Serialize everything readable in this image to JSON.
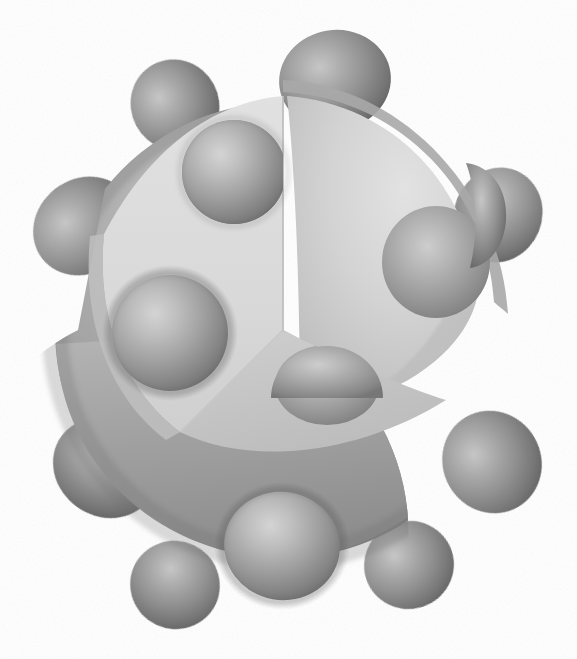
{
  "document": {
    "title": "Cutaway Sphere With Spherical Studs",
    "background_color": "#ffffff",
    "width": 577,
    "height": 659,
    "render_style": "3d-grayscale-illustration",
    "caption": ""
  },
  "palette": {
    "background": "#ffffff",
    "shell_outer_light": "#b4b4b4",
    "shell_outer_mid": "#9b9b9b",
    "shell_outer_dark": "#7e7e7e",
    "shell_outer_edge": "#6f6f6f",
    "cut_face_vertical": "#dcdcdc",
    "cut_face_horizontal": "#c6c6c6",
    "inner_cavity_light": "#d2d2d2",
    "inner_cavity_mid": "#bdbdbd",
    "stud_highlight": "#d6d6d6",
    "stud_mid": "#a2a2a2",
    "stud_shadow": "#6b6b6b",
    "stud_rim": "#5f5f5f",
    "cut_rim_band": "#aaaaaa"
  },
  "geometry": {
    "sphere": {
      "label": "main-sphere-body",
      "center_x": 283,
      "center_y": 330,
      "radius": 228,
      "description": "Large shaded sphere forming the body of the object"
    },
    "cutaway": {
      "label": "quadrant-cutaway",
      "type": "octant-removed",
      "apex_x": 283,
      "apex_y": 330,
      "top_edge_y": 88,
      "left_edge_x": 78,
      "faces": [
        {
          "name": "vertical-cut-face",
          "tone": "#dcdcdc",
          "orientation": "upper-left-plane"
        },
        {
          "name": "horizontal-cut-face",
          "tone": "#c6c6c6",
          "orientation": "lower-plane"
        },
        {
          "name": "inner-cavity-surface",
          "tone": "#cfcfcf",
          "orientation": "concave-interior"
        }
      ]
    },
    "stud_count_total": 14,
    "stud_count_outer": 10,
    "stud_count_interior": 4
  },
  "studs": [
    {
      "id": "stud-top",
      "cx": 335,
      "cy": 80,
      "rx": 56,
      "ry": 50,
      "rot": -8,
      "zone": "outer-silhouette",
      "tone": "dark"
    },
    {
      "id": "stud-upper-left",
      "cx": 175,
      "cy": 105,
      "rx": 44,
      "ry": 46,
      "rot": -28,
      "zone": "outer-silhouette",
      "tone": "dark"
    },
    {
      "id": "stud-left-upper",
      "cx": 84,
      "cy": 226,
      "rx": 53,
      "ry": 47,
      "rot": -38,
      "zone": "outer-silhouette",
      "tone": "dark"
    },
    {
      "id": "stud-left-lower",
      "cx": 105,
      "cy": 468,
      "rx": 54,
      "ry": 48,
      "rot": 36,
      "zone": "outer-silhouette",
      "tone": "dark"
    },
    {
      "id": "stud-bottom-left",
      "cx": 175,
      "cy": 585,
      "rx": 45,
      "ry": 44,
      "rot": 25,
      "zone": "outer-silhouette",
      "tone": "dark"
    },
    {
      "id": "stud-bottom-center",
      "cx": 282,
      "cy": 546,
      "rx": 58,
      "ry": 54,
      "rot": 10,
      "zone": "outer-front",
      "tone": "mid"
    },
    {
      "id": "stud-bottom-right",
      "cx": 409,
      "cy": 565,
      "rx": 45,
      "ry": 44,
      "rot": -18,
      "zone": "outer-silhouette",
      "tone": "dark"
    },
    {
      "id": "stud-right-lower",
      "cx": 492,
      "cy": 462,
      "rx": 49,
      "ry": 52,
      "rot": -30,
      "zone": "outer-silhouette",
      "tone": "dark"
    },
    {
      "id": "stud-right-upper",
      "cx": 498,
      "cy": 215,
      "rx": 44,
      "ry": 48,
      "rot": 22,
      "zone": "outer-silhouette",
      "tone": "dark"
    },
    {
      "id": "stud-face-upper-left",
      "cx": 234,
      "cy": 172,
      "rx": 52,
      "ry": 52,
      "rot": 0,
      "zone": "outer-front-clipped",
      "tone": "mid"
    },
    {
      "id": "stud-face-left-mid",
      "cx": 170,
      "cy": 333,
      "rx": 58,
      "ry": 58,
      "rot": 0,
      "zone": "outer-front",
      "tone": "mid"
    },
    {
      "id": "stud-cavity-right",
      "cx": 436,
      "cy": 262,
      "rx": 54,
      "ry": 56,
      "rot": 0,
      "zone": "inner-cavity",
      "tone": "mid"
    },
    {
      "id": "stud-cavity-floor",
      "cx": 327,
      "cy": 385,
      "rx": 52,
      "ry": 40,
      "rot": 0,
      "zone": "inner-cut-face",
      "tone": "mid"
    },
    {
      "id": "stud-rim-right",
      "cx": 476,
      "cy": 196,
      "rx": 28,
      "ry": 34,
      "rot": 18,
      "zone": "cut-rim",
      "tone": "dark"
    }
  ],
  "lighting": {
    "source": "upper-left",
    "highlight_offset_x_pct": 35,
    "highlight_offset_y_pct": 32,
    "ambient": "soft"
  },
  "labels": {
    "figure_name": "studded-sphere-cutaway",
    "alt_text": "Grey three-dimensional sphere covered in smaller spheres, with one quarter cut away to reveal a hollow interior containing more spheres."
  }
}
